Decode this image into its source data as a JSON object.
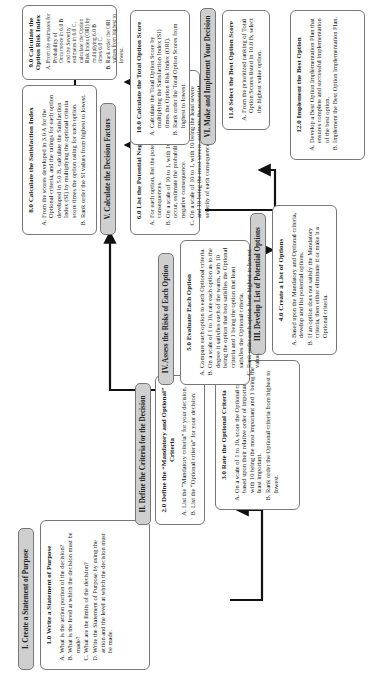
{
  "phases": [
    {
      "id": "I",
      "label": "I. Create a Statement of Purpose"
    },
    {
      "id": "II",
      "label": "II. Define the Criteria for the Decision"
    },
    {
      "id": "III",
      "label": "III. Develop  List of Potential Options"
    },
    {
      "id": "IV",
      "label": "IV. Assess the Risks of Each Option"
    },
    {
      "id": "V",
      "label": "V. Calculate the Decision Factors"
    },
    {
      "id": "VI",
      "label": "VI. Make and Implement Your Decision"
    }
  ],
  "steps": [
    {
      "title": "1.0 Write a Statement of Purpose",
      "items": [
        "What is the action portion of the decision?",
        "What is the level at which the decision must be made?",
        "What are the limits of the decision?",
        "Write the Statement of Purpose by using the action and the level at which the decision must be made."
      ]
    },
    {
      "title": "2.0 Define the “Mandatory and Optional” Criteria",
      "items": [
        "List the “Mandatory criteria” for your decision.",
        "List the “Optional criteria” for your decision."
      ]
    },
    {
      "title": "3.0  Rate the Optional Criteria",
      "items": [
        "On a scale of 1 to 10, score the Optional criteria based upon their relative order of importance with 10 being the most important and 1 being the least important.",
        "Rank order the Optional criteria from highest to lowest."
      ]
    },
    {
      "title": "4.0 Create a List of Options",
      "items": [
        "Based upon the Mandatory and Optional criteria, develop and list potential options.",
        "If an option does not satisfy the Mandatory criteria, then either eliminate it or make it a Optional criteria."
      ]
    },
    {
      "title": "5.0  Evaluate Each Option",
      "items": [
        "Compare each option to each Optional criteria.",
        "On a scale of 1 to 10, rate each option as to the degree it satisfies each of the wants, with 10 being the option that best satisfies the Optional criteria and 1 being the option that least satisfies the Optional criteria.",
        "Rank order each option from highest to lowest value."
      ]
    },
    {
      "title": "6.0 List the Potential Negative Consequences",
      "items": [
        "For each option, list the potential negative consequences.",
        "On a scale of 10 to 1, with 10 being the least likely to occur, estimate the probability of occurrence for each negative consequence.",
        "On a scale of 10 to 1, with 10 being the least severe and 10 being the most severe, estimate the potential severity of each consequence if it were to occur."
      ]
    },
    {
      "title": "8.0  Calculate the Satisfaction Index",
      "items": [
        "From the scores developed in 3.0 A for the Optional criteria, and the ratings for each option developed in 5.0 B, calculate the Satisfaction Index (SI) by multiplying the optional criteria score times the option rating for each option.",
        "Rank order the SI values from highest to lowest."
      ]
    },
    {
      "title": "9.0 Calculate the Option Risk Index",
      "items": [
        "From the estimates for Probability of Occurrence in 6.0 B and the Severity estimates in 6.0 C, calculate the Option Risk Index (ORI) by multiplying 6.0 B times 6.0 C.",
        "Rank order the ORI values from highest to lowest."
      ]
    },
    {
      "title": "10.0 Calculate the Total Option Score",
      "items": [
        "Calculate the Total Option Score by multiplying the Satisfaction Index (SI) times the Option Risk Index (ORI).",
        "Rank order the Total Option Scores from highest to lowest."
      ]
    },
    {
      "title": "11.0  Select the Best Option Score",
      "items": [
        "From the prioritized ranking of Total Option Scores listed in 10.0 B, select the highest value option."
      ]
    },
    {
      "title": "12.0 Implement the Best Option",
      "items": [
        "Develop a Best Option Implementation Plan that ensures complete and successful implementation of the best option.",
        "Implement the Best Option Implementation Plan."
      ]
    }
  ]
}
